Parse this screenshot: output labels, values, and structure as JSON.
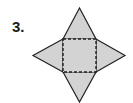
{
  "problem": {
    "number_label": "3."
  },
  "figure": {
    "fill_color": "#d3d3d3",
    "stroke_color": "#222222",
    "square": {
      "x": 63,
      "y": 39,
      "width": 33,
      "height": 33
    },
    "apexes": {
      "top": [
        79.5,
        8
      ],
      "left": [
        33,
        55.5
      ],
      "right": [
        125,
        55.5
      ],
      "bottom": [
        79.5,
        102
      ]
    }
  }
}
